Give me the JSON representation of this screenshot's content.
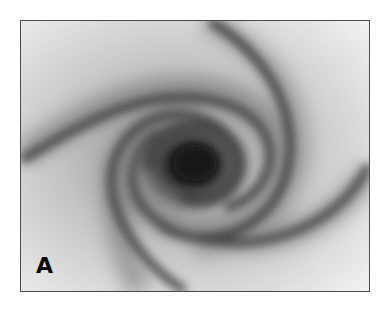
{
  "figure": {
    "panel_label": "A",
    "colors": {
      "background": "#ffffff",
      "frame": "#4a4a4a",
      "panel_light": "#f2f2f2",
      "core_dark": "#0e0e0e",
      "arm_dark": "#3a3a3a",
      "label": "#0a0a0a"
    }
  }
}
